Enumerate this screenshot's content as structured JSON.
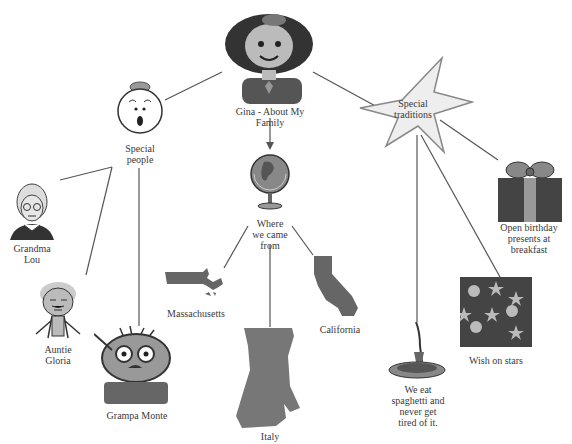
{
  "title": "Gina - About My Family",
  "nodes": {
    "root": {
      "label": "Gina - About My\nFamily",
      "icon": "girl-portrait-icon"
    },
    "special_people": {
      "label": "Special\npeople",
      "icon": "surprised-face-icon"
    },
    "grandma": {
      "label": "Grandma\nLou",
      "icon": "grandma-portrait-icon"
    },
    "auntie": {
      "label": "Auntie\nGloria",
      "icon": "auntie-figure-icon"
    },
    "grampa": {
      "label": "Grampa Monte",
      "icon": "grampa-face-icon"
    },
    "where": {
      "label": "Where\nwe came\nfrom",
      "icon": "globe-icon"
    },
    "massachusetts": {
      "label": "Massachusetts",
      "icon": "massachusetts-map-icon"
    },
    "italy": {
      "label": "Italy",
      "icon": "italy-map-icon"
    },
    "california": {
      "label": "California",
      "icon": "california-map-icon"
    },
    "traditions": {
      "label": "Special\ntraditions",
      "icon": "star-icon"
    },
    "birthday": {
      "label": "Open birthday\npresents at\nbreakfast",
      "icon": "gift-icon"
    },
    "stars": {
      "label": "Wish on stars",
      "icon": "night-sky-icon"
    },
    "spaghetti": {
      "label": "We eat\nspaghetti and\nnever get\ntired of it.",
      "icon": "spaghetti-plate-icon"
    }
  },
  "colors": {
    "line": "#555555",
    "fill_dark": "#444444",
    "fill_mid": "#777777",
    "fill_light": "#cccccc"
  }
}
